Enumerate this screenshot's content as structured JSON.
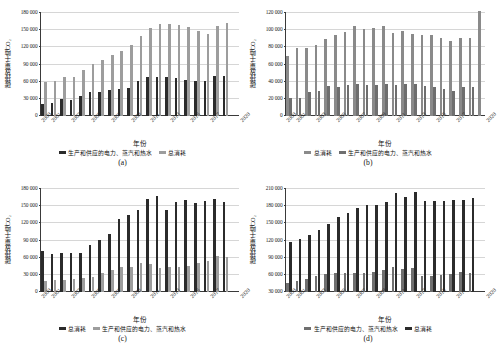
{
  "figure": {
    "years": [
      "2000",
      "2001",
      "2002",
      "2003",
      "2004",
      "2005",
      "2006",
      "2007",
      "2008",
      "2009",
      "2010",
      "2011",
      "2012",
      "2013",
      "2014",
      "2015",
      "2016",
      "2017",
      "2018",
      "2019",
      "2020"
    ],
    "xtick_labels": [
      "2000",
      "2001",
      "2003",
      "2005",
      "2007",
      "2009",
      "2011",
      "2013",
      "2015",
      "2017",
      "2020"
    ],
    "xlabel": "年份",
    "ylabel": "碳排放量/千吨CO₂",
    "series_names": {
      "electricity": "生产和供应的电力、蒸汽和热水",
      "total": "总消耗"
    },
    "colors": {
      "dark": "#2b2b2b",
      "light": "#9d9d9d",
      "mid": "#6f6f6f",
      "mid2": "#8a8a8a",
      "axis": "#3a3a3a",
      "gridline": "#d6d6d6"
    }
  },
  "panels": [
    {
      "caption": "(a)",
      "legend": [
        {
          "label": "生产和供应的电力、蒸汽和热水",
          "swatch": "dark"
        },
        {
          "label": "总消耗",
          "swatch": "light"
        }
      ]
    },
    {
      "caption": "(b)",
      "legend": [
        {
          "label": "总消耗",
          "swatch": "mid2"
        },
        {
          "label": "生产和供应的电力、蒸汽和热水",
          "swatch": "mid"
        }
      ]
    },
    {
      "caption": "(c)",
      "legend": [
        {
          "label": "总消耗",
          "swatch": "dark"
        },
        {
          "label": "生产和供应的电力、蒸汽和热水",
          "swatch": "light"
        }
      ]
    },
    {
      "caption": "(d)",
      "legend": [
        {
          "label": "生产和供应的电力、蒸汽和热水",
          "swatch": "mid"
        },
        {
          "label": "总消耗",
          "swatch": "dark"
        }
      ]
    }
  ],
  "chart_data": [
    {
      "panel": "(a)",
      "type": "bar",
      "title": "",
      "xlabel": "年份",
      "ylabel": "碳排放量/千吨CO₂",
      "ylim": [
        0,
        180000
      ],
      "yticks": [
        0,
        30000,
        60000,
        90000,
        120000,
        150000,
        180000
      ],
      "ytick_labels": [
        "0",
        "30 000",
        "60 000",
        "90 000",
        "120 000",
        "150 000",
        "180 000"
      ],
      "grid": true,
      "legend_position": "bottom",
      "categories": [
        "2000",
        "2001",
        "2002",
        "2003",
        "2004",
        "2005",
        "2006",
        "2007",
        "2008",
        "2009",
        "2010",
        "2011",
        "2012",
        "2013",
        "2014",
        "2015",
        "2016",
        "2017",
        "2018",
        "2019",
        "2020"
      ],
      "series": [
        {
          "name": "生产和供应的电力、蒸汽和热水",
          "color": "#2b2b2b",
          "values": [
            20000,
            22500,
            29500,
            28500,
            35500,
            41500,
            41500,
            44500,
            46500,
            49000,
            60000,
            67500,
            67500,
            67000,
            65500,
            63000,
            61000,
            61000,
            69500,
            69000,
            0
          ]
        },
        {
          "name": "总消耗",
          "color": "#9d9d9d",
          "values": [
            59000,
            60500,
            67500,
            67500,
            80000,
            90000,
            97000,
            105000,
            112000,
            123500,
            138000,
            152000,
            159500,
            158500,
            157000,
            154000,
            148000,
            142000,
            156000,
            161000,
            0
          ]
        }
      ]
    },
    {
      "panel": "(b)",
      "type": "bar",
      "title": "",
      "xlabel": "年份",
      "ylabel": "碳排放量/千吨CO₂",
      "ylim": [
        0,
        120000
      ],
      "yticks": [
        0,
        20000,
        40000,
        60000,
        80000,
        100000,
        120000
      ],
      "ytick_labels": [
        "0",
        "20 000",
        "40 000",
        "60 000",
        "80 000",
        "100 000",
        "120 000"
      ],
      "grid": true,
      "legend_position": "bottom",
      "categories": [
        "2000",
        "2001",
        "2002",
        "2003",
        "2004",
        "2005",
        "2006",
        "2007",
        "2008",
        "2009",
        "2010",
        "2011",
        "2012",
        "2013",
        "2014",
        "2015",
        "2016",
        "2017",
        "2018",
        "2019",
        "2020"
      ],
      "series": [
        {
          "name": "总消耗",
          "color": "#8a8a8a",
          "values": [
            69000,
            78500,
            78500,
            82000,
            88500,
            93000,
            97000,
            103500,
            100000,
            101000,
            103500,
            95500,
            98000,
            94500,
            94000,
            93500,
            90500,
            86000,
            90500,
            89500,
            121000
          ]
        },
        {
          "name": "生产和供应的电力、蒸汽和热水",
          "color": "#6f6f6f",
          "values": [
            20500,
            21000,
            27500,
            29000,
            35000,
            34000,
            35500,
            37000,
            36000,
            36000,
            36500,
            36000,
            37000,
            36500,
            35000,
            33000,
            31000,
            28500,
            33000,
            33000,
            0
          ]
        }
      ]
    },
    {
      "panel": "(c)",
      "type": "bar",
      "title": "",
      "xlabel": "年份",
      "ylabel": "碳排放量/千吨CO₂",
      "ylim": [
        0,
        180000
      ],
      "yticks": [
        0,
        30000,
        60000,
        90000,
        120000,
        150000,
        180000
      ],
      "ytick_labels": [
        "0",
        "30 000",
        "60 000",
        "90 000",
        "120 000",
        "150 000",
        "180 000"
      ],
      "grid": true,
      "legend_position": "bottom",
      "categories": [
        "2000",
        "2001",
        "2002",
        "2003",
        "2004",
        "2005",
        "2006",
        "2007",
        "2008",
        "2009",
        "2010",
        "2011",
        "2012",
        "2013",
        "2014",
        "2015",
        "2016",
        "2017",
        "2018",
        "2019",
        "2020"
      ],
      "series": [
        {
          "name": "总消耗",
          "color": "#2b2b2b",
          "values": [
            70500,
            66000,
            67500,
            67500,
            67500,
            81500,
            90500,
            101000,
            127000,
            134000,
            142000,
            161000,
            165500,
            142000,
            155500,
            159500,
            154500,
            158000,
            161000,
            155000,
            0
          ]
        },
        {
          "name": "生产和供应的电力、蒸汽和热水",
          "color": "#9d9d9d",
          "values": [
            19000,
            20000,
            21000,
            22000,
            23500,
            26000,
            32500,
            38500,
            43000,
            42500,
            51000,
            48500,
            41500,
            42500,
            43000,
            44500,
            50500,
            54000,
            63000,
            60000,
            0
          ]
        }
      ]
    },
    {
      "panel": "(d)",
      "type": "bar",
      "title": "",
      "xlabel": "年份",
      "ylabel": "碳排放量/千吨CO₂",
      "ylim": [
        30000,
        210000
      ],
      "yticks": [
        30000,
        60000,
        90000,
        120000,
        150000,
        180000,
        210000
      ],
      "ytick_labels": [
        "30 000",
        "60 000",
        "90 000",
        "120 000",
        "150 000",
        "180 000",
        "210 000"
      ],
      "grid": true,
      "legend_position": "bottom",
      "categories": [
        "2000",
        "2001",
        "2002",
        "2003",
        "2004",
        "2005",
        "2006",
        "2007",
        "2008",
        "2009",
        "2010",
        "2011",
        "2012",
        "2013",
        "2014",
        "2015",
        "2016",
        "2017",
        "2018",
        "2019",
        "2020"
      ],
      "series": [
        {
          "name": "生产和供应的电力、蒸汽和热水",
          "color": "#6f6f6f",
          "values": [
            45000,
            49500,
            53000,
            58000,
            61000,
            62500,
            62500,
            63000,
            63500,
            64500,
            67500,
            74000,
            69500,
            71000,
            58500,
            57500,
            59500,
            61000,
            65500,
            63500,
            0
          ]
        },
        {
          "name": "总消耗",
          "color": "#2b2b2b",
          "values": [
            117000,
            122000,
            129000,
            137000,
            148500,
            159000,
            166000,
            175500,
            180000,
            180500,
            186000,
            201000,
            195000,
            203000,
            187000,
            187500,
            187500,
            189500,
            189500,
            192000,
            0
          ]
        }
      ]
    }
  ]
}
